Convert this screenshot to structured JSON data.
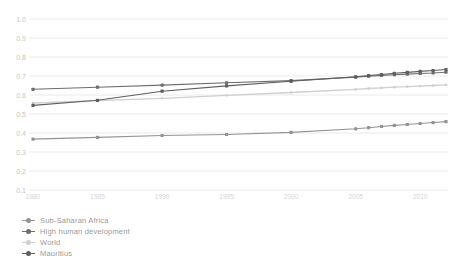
{
  "chart_data": {
    "type": "line",
    "title": "",
    "xlabel": "",
    "ylabel": "",
    "x": [
      1980,
      1985,
      1990,
      1995,
      2000,
      2005,
      2006,
      2007,
      2008,
      2009,
      2010,
      2011,
      2012
    ],
    "x_tick_labels": [
      "1980",
      "1985",
      "1990",
      "1995",
      "2000",
      "2005",
      "2010"
    ],
    "x_tick_years": [
      1980,
      1985,
      1990,
      1995,
      2000,
      2005,
      2010
    ],
    "y_tick_labels": [
      "1.0",
      "0.9",
      "0.8",
      "0.7",
      "0.6",
      "0.5",
      "0.4",
      "0.3",
      "0.2",
      "0.1"
    ],
    "y_ticks": [
      1.0,
      0.9,
      0.8,
      0.7,
      0.6,
      0.5,
      0.4,
      0.3,
      0.2,
      0.1
    ],
    "ylim": [
      0.1,
      1.0
    ],
    "xlim": [
      1980,
      2012
    ],
    "grid": true,
    "legend_position": "bottom-left",
    "series": [
      {
        "name": "Sub-Saharan Africa",
        "color": "#949494",
        "marker": "square",
        "values": [
          0.368,
          0.377,
          0.387,
          0.392,
          0.403,
          0.422,
          0.428,
          0.434,
          0.44,
          0.445,
          0.45,
          0.455,
          0.46
        ]
      },
      {
        "name": "High human development",
        "color": "#6e6e6e",
        "marker": "square",
        "values": [
          0.63,
          0.641,
          0.652,
          0.664,
          0.676,
          0.694,
          0.699,
          0.703,
          0.707,
          0.71,
          0.713,
          0.716,
          0.72
        ]
      },
      {
        "name": "World",
        "color": "#cfcfcf",
        "marker": "square",
        "values": [
          0.558,
          0.57,
          0.582,
          0.598,
          0.613,
          0.63,
          0.634,
          0.638,
          0.641,
          0.644,
          0.647,
          0.65,
          0.653
        ]
      },
      {
        "name": "Mauritius",
        "color": "#5f5f5f",
        "marker": "square",
        "values": [
          0.545,
          0.572,
          0.62,
          0.648,
          0.672,
          0.696,
          0.702,
          0.708,
          0.714,
          0.719,
          0.724,
          0.729,
          0.734
        ]
      }
    ]
  },
  "style_colors": {
    "grid_line": "#eaeaea",
    "y_tick_text": "#c6c6c6",
    "x_tick_text": "#d3d3d3",
    "background": "#ffffff"
  }
}
